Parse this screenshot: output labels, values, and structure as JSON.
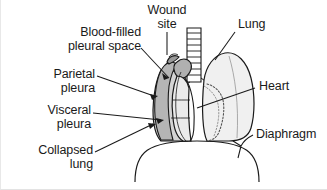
{
  "figure": {
    "background_color": "#ffffff",
    "border_color": "#e8e8e8",
    "line_color": "#1a1a1a",
    "text_color": "#1a1a1a"
  },
  "labels": {
    "wound_site": "Wound\nsite",
    "blood_filled_pleural_space": "Blood-filled\npleural space",
    "parietal_pleura": "Parietal\npleura",
    "visceral_pleura": "Visceral\npleura",
    "collapsed_lung": "Collapsed\nlung",
    "lung": "Lung",
    "heart": "Heart",
    "diaphragm": "Diaphragm"
  },
  "anatomy": {
    "trachea": {
      "name": "trachea",
      "ring_count": 9,
      "fill": "#ffffff",
      "stroke": "#1a1a1a"
    },
    "right_lung": {
      "name": "lung",
      "state": "inflated",
      "fill": "#f0f0f0",
      "stroke": "#1a1a1a"
    },
    "collapsed_lung": {
      "name": "collapsed-lung",
      "state": "collapsed",
      "fill": "#eaeaea",
      "stroke": "#1a1a1a"
    },
    "pleural_space": {
      "name": "blood-filled-pleural-space",
      "fill": "#b5b5b5",
      "stroke": "#1a1a1a"
    },
    "parietal_pleura": {
      "name": "parietal-pleura",
      "fill": "#d4d4d4",
      "stroke": "#1a1a1a"
    },
    "heart": {
      "name": "heart",
      "outline_style": "dotted",
      "fill": "none",
      "stroke": "#555555"
    },
    "diaphragm": {
      "name": "diaphragm",
      "fill": "none",
      "stroke": "#1a1a1a"
    },
    "wound": {
      "name": "wound-site",
      "fill": "#9a9a9a",
      "stroke": "#1a1a1a"
    }
  }
}
